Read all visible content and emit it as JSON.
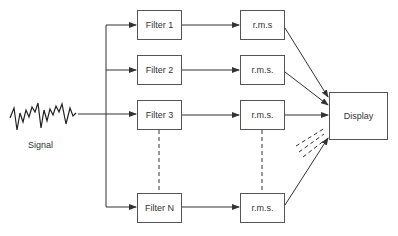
{
  "diagram": {
    "input": {
      "label": "Signal",
      "icon": "noisy-waveform-icon"
    },
    "filters": [
      {
        "label": "Filter 1"
      },
      {
        "label": "Filter 2"
      },
      {
        "label": "Filter 3"
      },
      {
        "label": "Filter N"
      }
    ],
    "rms_blocks": [
      {
        "label": "r.m.s"
      },
      {
        "label": "r.m.s."
      },
      {
        "label": "r.m.s."
      },
      {
        "label": "r.m.s."
      }
    ],
    "output": {
      "label": "Display"
    },
    "colors": {
      "line": "#333333",
      "box_border": "#555555",
      "text": "#333333"
    }
  }
}
